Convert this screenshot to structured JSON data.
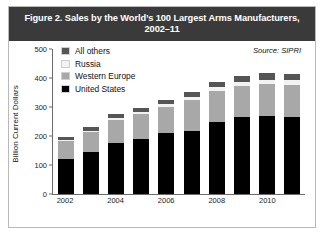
{
  "figure": {
    "title": "Figure 2. Sales by the World’s 100 Largest Arms Manufacturers, 2002–11",
    "source": "Source: SIPRI"
  },
  "colors": {
    "title_band": "#3a3a3a",
    "title_text": "#ffffff",
    "united_states": "#000000",
    "western_europe": "#a8a8a8",
    "russia": "#f2f2f2",
    "all_others": "#555555",
    "axis": "#6b6b6b",
    "frame": "#b9b9b9"
  },
  "chart_data": {
    "type": "bar",
    "stacked": true,
    "title": "Figure 2. Sales by the World’s 100 Largest Arms Manufacturers, 2002–11",
    "xlabel": "",
    "ylabel": "Billion Current Dollars",
    "ylim": [
      0,
      500
    ],
    "yticks": [
      0,
      100,
      200,
      300,
      400,
      500
    ],
    "ytick_labels": [
      "0",
      "100",
      "200",
      "300",
      "400",
      "500"
    ],
    "grid": false,
    "legend_position": "upper-left",
    "categories": [
      "2002",
      "2003",
      "2004",
      "2005",
      "2006",
      "2007",
      "2008",
      "2009",
      "2010",
      "2011"
    ],
    "xtick_labels": [
      "2002",
      "",
      "2004",
      "",
      "2006",
      "",
      "2008",
      "",
      "2010",
      ""
    ],
    "series": [
      {
        "name": "United States",
        "color": "#000000",
        "values": [
          120,
          145,
          175,
          190,
          210,
          218,
          248,
          265,
          268,
          265
        ]
      },
      {
        "name": "Western Europe",
        "color": "#a8a8a8",
        "values": [
          62,
          68,
          80,
          85,
          90,
          105,
          108,
          108,
          112,
          112
        ]
      },
      {
        "name": "Russia",
        "color": "#f2f2f2",
        "values": [
          5,
          6,
          7,
          8,
          9,
          11,
          12,
          13,
          14,
          15
        ]
      },
      {
        "name": "All others",
        "color": "#555555",
        "values": [
          8,
          11,
          13,
          15,
          16,
          18,
          20,
          22,
          22,
          23
        ]
      }
    ],
    "totals": [
      195,
      230,
      275,
      298,
      325,
      352,
      388,
      408,
      416,
      415
    ],
    "units": "Billion Current Dollars",
    "annotations": [
      "Source: SIPRI"
    ]
  }
}
